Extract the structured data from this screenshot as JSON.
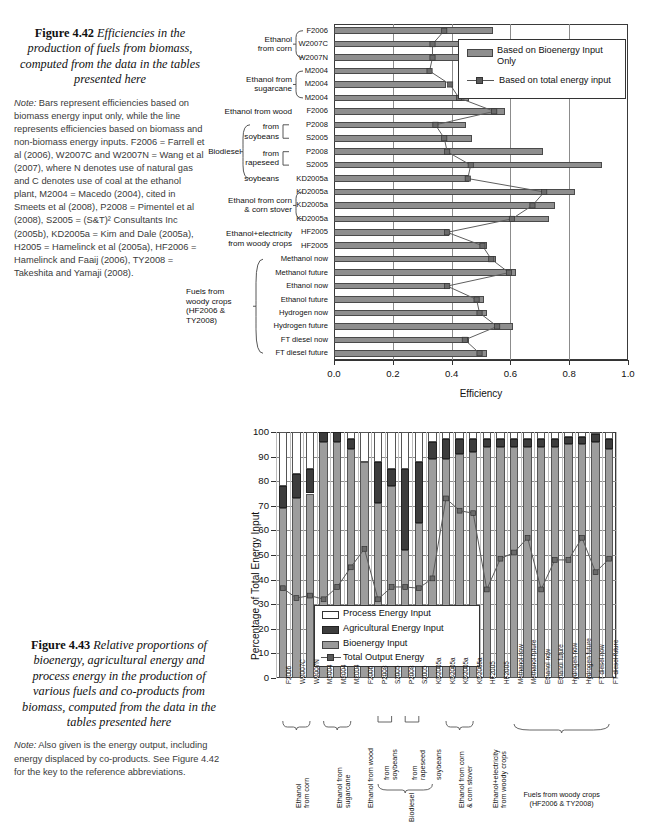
{
  "figure442": {
    "caption_number": "Figure 4.42",
    "caption_text": "Efficiencies in the production of fuels from biomass, computed from the data in the tables presented here",
    "note_label": "Note:",
    "note_text": " Bars represent efficiencies based on biomass energy input only, while the line represents efficiencies based on biomass and non-biomass energy inputs. F2006 = Farrell et al (2006), W2007C and W2007N = Wang et al (2007), where N denotes use of natural gas and C denotes use of coal at the ethanol plant, M2004 = Macedo (2004), cited in Smeets et al (2008), P2008 = Pimentel et al (2008), S2005 = (S&T)² Consultants Inc (2005b), KD2005a = Kim and Dale (2005a), H2005 = Hamelinck et al (2005a), HF2006 = Hamelinck and Faaij (2006), TY2008 = Takeshita and Yamaji (2008)."
  },
  "figure443": {
    "caption_number": "Figure 4.43",
    "caption_text": "Relative proportions of bioenergy, agricultural energy and process energy in the production of various fuels and co-products from biomass, computed from the data in the tables presented here",
    "note_label": "Note:",
    "note_text": " Also given is the energy output, including energy displaced by co-products. See Figure 4.42 for the key to the reference abbreviations."
  },
  "chart_data": [
    {
      "type": "bar",
      "orientation": "horizontal",
      "title": "",
      "xlabel": "Efficiency",
      "ylabel": "",
      "xlim": [
        0.0,
        1.0
      ],
      "xticks": [
        "0.0",
        "0.2",
        "0.4",
        "0.6",
        "0.8",
        "1.0"
      ],
      "xtick_values": [
        0.0,
        0.2,
        0.4,
        0.6,
        0.8,
        1.0
      ],
      "grid": true,
      "legend_position": "top-right",
      "legend": [
        "Based on Bioenergy Input Only",
        "Based on total energy input"
      ],
      "categories": [
        "F2006",
        "W2007C",
        "W2007N",
        "M2004",
        "M2004",
        "M2004",
        "F2006",
        "P2008",
        "S2005",
        "P2008",
        "S2005",
        "KD2005a",
        "KD2005a",
        "KD2005a",
        "KD2005a",
        "HF2005",
        "HF2005",
        "Methanol now",
        "Methanol future",
        "Ethanol now",
        "Ethanol future",
        "Hydrogen now",
        "Hydrogen future",
        "FT diesel now",
        "FT diesel future"
      ],
      "series": [
        {
          "name": "Based on Bioenergy Input Only",
          "values": [
            0.54,
            0.45,
            0.45,
            0.33,
            0.38,
            0.46,
            0.58,
            0.45,
            0.47,
            0.71,
            0.91,
            0.46,
            0.82,
            0.75,
            0.73,
            0.39,
            0.52,
            0.55,
            0.62,
            0.39,
            0.51,
            0.52,
            0.61,
            0.46,
            0.52
          ]
        },
        {
          "name": "Based on total energy input",
          "values": [
            0.375,
            0.335,
            0.335,
            0.325,
            0.395,
            0.425,
            0.545,
            0.345,
            0.375,
            0.385,
            0.465,
            0.455,
            0.715,
            0.675,
            0.605,
            0.385,
            0.505,
            0.535,
            0.595,
            0.385,
            0.485,
            0.495,
            0.555,
            0.445,
            0.495
          ]
        }
      ],
      "group_brackets": [
        {
          "label": "Ethanol from corn",
          "start": 0,
          "end": 2,
          "brace": "curly"
        },
        {
          "label": "Ethanol from sugarcane",
          "start": 3,
          "end": 5,
          "brace": "curly"
        },
        {
          "label": "Ethanol from wood",
          "start": 6,
          "end": 6,
          "brace": "none"
        },
        {
          "label": "from soybeans",
          "start": 7,
          "end": 8,
          "brace": "square"
        },
        {
          "label": "from rapeseed",
          "start": 9,
          "end": 10,
          "brace": "square"
        },
        {
          "label": "soybeans",
          "start": 11,
          "end": 11,
          "brace": "none"
        },
        {
          "label": "Biodiesel",
          "start": 7,
          "end": 11,
          "brace": "curly-outer"
        },
        {
          "label": "Ethanol from corn & corn stover",
          "start": 12,
          "end": 14,
          "brace": "curly"
        },
        {
          "label": "Ethanol+electricity from woody crops",
          "start": 15,
          "end": 16,
          "brace": "none"
        },
        {
          "label": "Fuels from woody crops (HF2006 & TY2008)",
          "start": 17,
          "end": 24,
          "brace": "curly"
        }
      ]
    },
    {
      "type": "bar",
      "orientation": "vertical",
      "stacked": true,
      "title": "",
      "xlabel": "",
      "ylabel": "Percentage of Total Energy Input",
      "ylim": [
        0,
        100
      ],
      "yticks": [
        "0",
        "10",
        "20",
        "30",
        "40",
        "50",
        "60",
        "70",
        "80",
        "90",
        "100"
      ],
      "ytick_values": [
        0,
        10,
        20,
        30,
        40,
        50,
        60,
        70,
        80,
        90,
        100
      ],
      "grid": true,
      "legend_position": "inside-bottom-left",
      "legend": [
        "Process Energy Input",
        "Agricultural Energy Input",
        "Bioenergy Input",
        "Total Output Energy"
      ],
      "categories": [
        "F2006",
        "W2007C",
        "W2007N",
        "M2004",
        "M2004",
        "M2004",
        "F2006",
        "P2008",
        "S2005",
        "P2008",
        "S2005",
        "KD2005a",
        "KD2005a",
        "KD2005a",
        "KD2005a",
        "HF2005",
        "HF2005",
        "Methanol now",
        "Methanol future",
        "Ethanol now",
        "Ethanol future",
        "Hydrogen now",
        "Hydrogen future",
        "FT diesel now",
        "FT diesel future"
      ],
      "series": [
        {
          "name": "Bioenergy Input",
          "values": [
            69,
            73,
            75,
            96,
            96,
            93,
            88,
            71,
            78,
            52,
            63,
            89,
            89,
            91,
            92,
            94,
            94,
            94,
            94,
            94,
            94,
            95,
            95,
            96,
            93
          ]
        },
        {
          "name": "Agricultural Energy Input",
          "values": [
            9,
            10,
            10,
            4,
            4,
            4,
            0,
            17,
            7,
            33,
            25,
            7,
            8,
            6,
            5,
            3,
            3,
            3,
            3,
            3,
            3,
            3,
            3,
            3,
            4
          ]
        },
        {
          "name": "Process Energy Input",
          "values": [
            22,
            17,
            15,
            0,
            0,
            3,
            12,
            12,
            15,
            15,
            12,
            4,
            3,
            3,
            3,
            3,
            3,
            3,
            3,
            3,
            3,
            2,
            2,
            1,
            3
          ]
        },
        {
          "name": "Total Output Energy",
          "values": [
            36.5,
            32.5,
            33.5,
            32,
            37,
            45,
            52.5,
            32,
            37,
            37,
            36.5,
            40.5,
            73,
            68,
            67,
            36,
            48.5,
            51,
            57,
            36,
            48,
            48,
            57,
            43,
            48.5
          ]
        }
      ],
      "group_brackets": [
        {
          "label": "Ethanol from corn",
          "start": 0,
          "end": 2
        },
        {
          "label": "Ethanol from sugarcane",
          "start": 3,
          "end": 5
        },
        {
          "label": "Ethanol from wood",
          "start": 6,
          "end": 6
        },
        {
          "label": "from soybeans",
          "start": 7,
          "end": 8
        },
        {
          "label": "from rapeseed",
          "start": 9,
          "end": 10
        },
        {
          "label": "soybeans",
          "start": 11,
          "end": 11
        },
        {
          "label": "Biodiesel",
          "start": 7,
          "end": 11
        },
        {
          "label": "Ethanol from corn & corn stover",
          "start": 12,
          "end": 14
        },
        {
          "label": "Ethanol+electricity from woody crops",
          "start": 15,
          "end": 16
        },
        {
          "label": "Fuels from woody crops (HF2006 & TY2008)",
          "start": 17,
          "end": 24
        }
      ]
    }
  ]
}
